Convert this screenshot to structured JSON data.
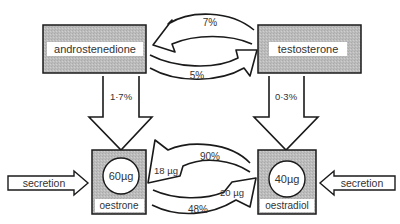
{
  "nodes": {
    "androstenedione": {
      "label": "androstenedione"
    },
    "testosterone": {
      "label": "testosterone"
    },
    "oestrone": {
      "label": "oestrone",
      "amount": "60µg"
    },
    "oestradiol": {
      "label": "oestradiol",
      "amount": "40µg"
    }
  },
  "edges": {
    "testosterone_to_androstenedione": {
      "label": "7%"
    },
    "androstenedione_to_testosterone": {
      "label": "5%"
    },
    "androstenedione_to_oestrone": {
      "label": "1·7%"
    },
    "testosterone_to_oestradiol": {
      "label": "0·3%"
    },
    "oestradiol_to_oestrone": {
      "label": "90%",
      "amount": "18 µg"
    },
    "oestrone_to_oestradiol": {
      "label": "48%",
      "amount": "20 µg"
    },
    "secretion_left": {
      "label": "secretion"
    },
    "secretion_right": {
      "label": "secretion"
    }
  },
  "colors": {
    "box_fill": "#b9b9b9",
    "stroke": "#1a1a1a",
    "label_bg": "#ffffff"
  }
}
